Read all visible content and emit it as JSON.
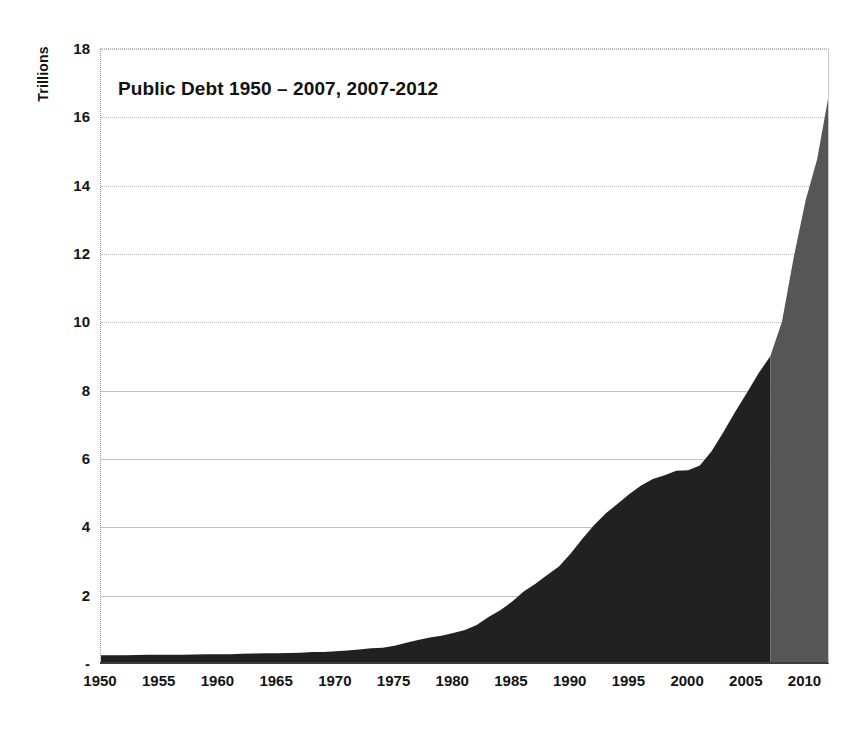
{
  "chart_data": {
    "type": "area",
    "title": "Public Debt 1950 – 2007, 2007-2012",
    "xlabel": "",
    "ylabel": "Trillions",
    "ylim": [
      0,
      18
    ],
    "xlim": [
      1950,
      2012
    ],
    "grid": true,
    "legend_position": "none",
    "y_ticks": [
      {
        "value": 0,
        "label": "-"
      },
      {
        "value": 2,
        "label": "2"
      },
      {
        "value": 4,
        "label": "4"
      },
      {
        "value": 6,
        "label": "6"
      },
      {
        "value": 8,
        "label": "8"
      },
      {
        "value": 10,
        "label": "10"
      },
      {
        "value": 12,
        "label": "12"
      },
      {
        "value": 14,
        "label": "14"
      },
      {
        "value": 16,
        "label": "16"
      },
      {
        "value": 18,
        "label": "18"
      }
    ],
    "x_ticks": [
      {
        "value": 1950,
        "label": "1950"
      },
      {
        "value": 1955,
        "label": "1955"
      },
      {
        "value": 1960,
        "label": "1960"
      },
      {
        "value": 1965,
        "label": "1965"
      },
      {
        "value": 1970,
        "label": "1970"
      },
      {
        "value": 1975,
        "label": "1975"
      },
      {
        "value": 1980,
        "label": "1980"
      },
      {
        "value": 1985,
        "label": "1985"
      },
      {
        "value": 1990,
        "label": "1990"
      },
      {
        "value": 1995,
        "label": "1995"
      },
      {
        "value": 2000,
        "label": "2000"
      },
      {
        "value": 2005,
        "label": "2005"
      },
      {
        "value": 2010,
        "label": "2010"
      }
    ],
    "colors": {
      "historical": "#212121",
      "projection": "#565656",
      "gridline": "#a8a8a8",
      "axis": "#3d3d3d",
      "text": "#141414",
      "background": "#ffffff"
    },
    "series": [
      {
        "name": "Public Debt 1950 – 2007",
        "color": "#212121",
        "x": [
          1950,
          1951,
          1952,
          1953,
          1954,
          1955,
          1956,
          1957,
          1958,
          1959,
          1960,
          1961,
          1962,
          1963,
          1964,
          1965,
          1966,
          1967,
          1968,
          1969,
          1970,
          1971,
          1972,
          1973,
          1974,
          1975,
          1976,
          1977,
          1978,
          1979,
          1980,
          1981,
          1982,
          1983,
          1984,
          1985,
          1986,
          1987,
          1988,
          1989,
          1990,
          1991,
          1992,
          1993,
          1994,
          1995,
          1996,
          1997,
          1998,
          1999,
          2000,
          2001,
          2002,
          2003,
          2004,
          2005,
          2006,
          2007
        ],
        "values": [
          0.257,
          0.255,
          0.259,
          0.266,
          0.271,
          0.274,
          0.273,
          0.271,
          0.276,
          0.285,
          0.287,
          0.289,
          0.298,
          0.306,
          0.312,
          0.317,
          0.32,
          0.326,
          0.348,
          0.354,
          0.371,
          0.398,
          0.427,
          0.458,
          0.475,
          0.533,
          0.621,
          0.699,
          0.772,
          0.827,
          0.908,
          0.998,
          1.142,
          1.377,
          1.572,
          1.823,
          2.125,
          2.35,
          2.602,
          2.857,
          3.233,
          3.665,
          4.065,
          4.411,
          4.693,
          4.974,
          5.225,
          5.413,
          5.526,
          5.656,
          5.674,
          5.807,
          6.228,
          6.783,
          7.379,
          7.933,
          8.507,
          9.008
        ]
      },
      {
        "name": "Public Debt 2007-2012 (projection)",
        "color": "#565656",
        "x": [
          2007,
          2008,
          2009,
          2010,
          2011,
          2012
        ],
        "values": [
          9.008,
          10.025,
          11.91,
          13.562,
          14.79,
          16.7
        ]
      }
    ],
    "annotations": [
      {
        "text": "Public Debt 1950 – 2007, 2007-2012",
        "role": "in-plot-title"
      }
    ]
  }
}
